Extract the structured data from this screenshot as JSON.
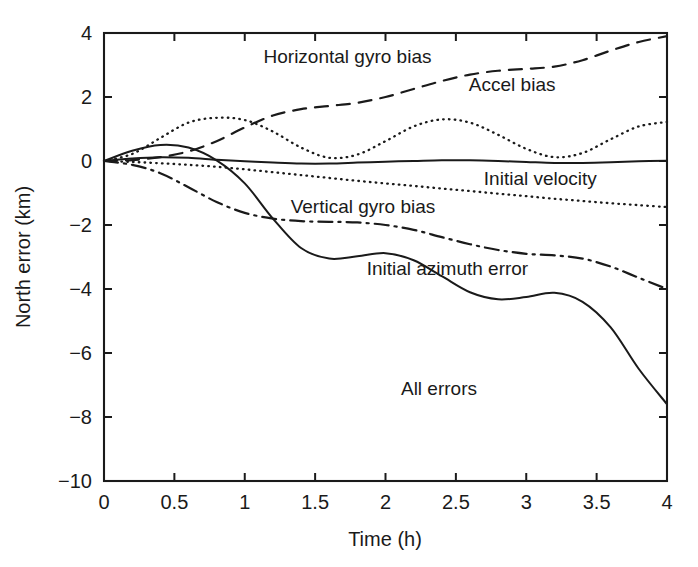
{
  "chart_data": {
    "type": "line",
    "title": "",
    "xlabel": "Time (h)",
    "ylabel": "North error (km)",
    "xlim": [
      0,
      4
    ],
    "ylim": [
      -10,
      4
    ],
    "xticks": [
      "0",
      "0.5",
      "1",
      "1.5",
      "2",
      "2.5",
      "3",
      "3.5",
      "4"
    ],
    "xtick_values": [
      0,
      0.5,
      1,
      1.5,
      2,
      2.5,
      3,
      3.5,
      4
    ],
    "yticks": [
      "4",
      "2",
      "0",
      "−2",
      "−4",
      "−6",
      "−8",
      "−10"
    ],
    "ytick_values": [
      4,
      2,
      0,
      -2,
      -4,
      -6,
      -8,
      -10
    ],
    "grid": false,
    "legend_position": "inline-annotations",
    "x": [
      0,
      0.2,
      0.4,
      0.6,
      0.8,
      1.0,
      1.2,
      1.4,
      1.6,
      1.8,
      2.0,
      2.2,
      2.4,
      2.6,
      2.8,
      3.0,
      3.2,
      3.4,
      3.6,
      3.8,
      4.0
    ],
    "series": [
      {
        "name": "Horizontal gyro bias",
        "style": "dashed",
        "label_x": 1.73,
        "label_y": 3.05,
        "values": [
          0.0,
          0.03,
          0.12,
          0.3,
          0.62,
          1.05,
          1.42,
          1.62,
          1.72,
          1.82,
          2.0,
          2.25,
          2.5,
          2.7,
          2.82,
          2.88,
          2.95,
          3.15,
          3.45,
          3.72,
          3.9
        ]
      },
      {
        "name": "Accel bias",
        "style": "dotted",
        "label_x": 2.9,
        "label_y": 2.2,
        "values": [
          0.0,
          0.22,
          0.72,
          1.2,
          1.35,
          1.28,
          0.92,
          0.42,
          0.1,
          0.2,
          0.62,
          1.08,
          1.3,
          1.2,
          0.82,
          0.38,
          0.12,
          0.25,
          0.68,
          1.08,
          1.22
        ]
      },
      {
        "name": "Initial velocity",
        "style": "solid-flat",
        "label_x": 3.1,
        "label_y": -0.75,
        "values": [
          0.0,
          0.08,
          0.12,
          0.1,
          0.04,
          -0.01,
          -0.05,
          -0.08,
          -0.08,
          -0.05,
          -0.02,
          0.0,
          0.02,
          0.02,
          0.0,
          -0.03,
          -0.06,
          -0.06,
          -0.04,
          -0.01,
          0.01
        ]
      },
      {
        "name": "Vertical gyro bias",
        "style": "dotted",
        "label_x": 1.84,
        "label_y": -1.62,
        "values": [
          0.0,
          -0.03,
          -0.07,
          -0.12,
          -0.18,
          -0.26,
          -0.35,
          -0.44,
          -0.53,
          -0.62,
          -0.7,
          -0.78,
          -0.86,
          -0.94,
          -1.02,
          -1.1,
          -1.18,
          -1.25,
          -1.32,
          -1.38,
          -1.44
        ]
      },
      {
        "name": "Initial azimuth error",
        "style": "dashdot",
        "label_x": 2.44,
        "label_y": -3.55,
        "values": [
          0.0,
          -0.12,
          -0.38,
          -0.82,
          -1.28,
          -1.62,
          -1.8,
          -1.88,
          -1.9,
          -1.92,
          -2.0,
          -2.15,
          -2.38,
          -2.6,
          -2.78,
          -2.9,
          -2.95,
          -3.05,
          -3.3,
          -3.65,
          -4.0
        ]
      },
      {
        "name": "All errors",
        "style": "solid",
        "label_x": 2.38,
        "label_y": -7.3,
        "values": [
          0.0,
          0.32,
          0.5,
          0.42,
          0.02,
          -0.7,
          -1.8,
          -2.72,
          -3.05,
          -2.98,
          -2.88,
          -3.1,
          -3.6,
          -4.1,
          -4.32,
          -4.25,
          -4.12,
          -4.4,
          -5.2,
          -6.5,
          -7.6
        ]
      }
    ]
  }
}
